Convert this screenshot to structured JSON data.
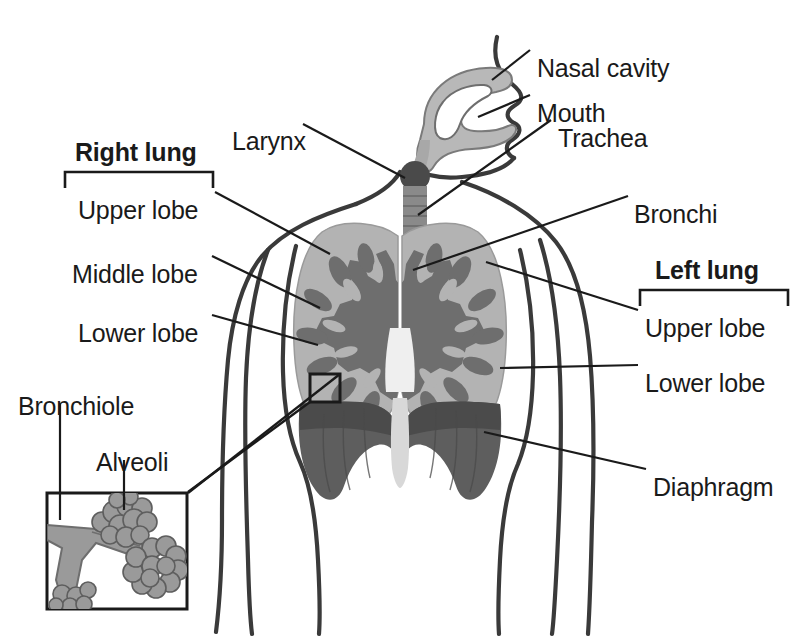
{
  "diagram": {
    "background_color": "#ffffff",
    "ink_color": "#3a3a3a",
    "text_color": "#1a1a1a",
    "palette": {
      "lung_tissue": "#b3b3b3",
      "bronchial_tree": "#6e6e6e",
      "diaphragm": "#5e5e5e",
      "trachea": "#8a8a8a",
      "larynx": "#4a4a4a",
      "head_cavity": "#b8b8b8",
      "mediastinum": "#efefef",
      "alveoli": "#9a9a9a"
    }
  },
  "group_labels": [
    {
      "id": "right-lung",
      "text": "Right lung",
      "x": 75,
      "y": 140,
      "bracket": {
        "x": 65,
        "y": 172,
        "width": 148
      }
    },
    {
      "id": "left-lung",
      "text": "Left lung",
      "x": 655,
      "y": 258,
      "bracket": {
        "x": 640,
        "y": 290,
        "width": 148
      }
    }
  ],
  "labels": [
    {
      "id": "nasal-cavity",
      "text": "Nasal cavity",
      "x": 537,
      "y": 56,
      "align": "left"
    },
    {
      "id": "mouth",
      "text": "Mouth",
      "x": 537,
      "y": 101,
      "align": "left"
    },
    {
      "id": "trachea",
      "text": "Trachea",
      "x": 558,
      "y": 126,
      "align": "left"
    },
    {
      "id": "bronchi",
      "text": "Bronchi",
      "x": 634,
      "y": 202,
      "align": "left"
    },
    {
      "id": "larynx",
      "text": "Larynx",
      "x": 232,
      "y": 129,
      "align": "left"
    },
    {
      "id": "right-upper-lobe",
      "text": "Upper lobe",
      "x": 78,
      "y": 198,
      "align": "left"
    },
    {
      "id": "right-middle-lobe",
      "text": "Middle lobe",
      "x": 72,
      "y": 262,
      "align": "left"
    },
    {
      "id": "right-lower-lobe",
      "text": "Lower lobe",
      "x": 78,
      "y": 321,
      "align": "left"
    },
    {
      "id": "left-upper-lobe",
      "text": "Upper lobe",
      "x": 645,
      "y": 316,
      "align": "left"
    },
    {
      "id": "left-lower-lobe",
      "text": "Lower lobe",
      "x": 645,
      "y": 371,
      "align": "left"
    },
    {
      "id": "diaphragm",
      "text": "Diaphragm",
      "x": 653,
      "y": 475,
      "align": "left"
    },
    {
      "id": "bronchiole",
      "text": "Bronchiole",
      "x": 18,
      "y": 394,
      "align": "left"
    },
    {
      "id": "alveoli",
      "text": "Alveoli",
      "x": 96,
      "y": 450,
      "align": "left"
    }
  ],
  "inset": {
    "id": "alveoli-detail-inset",
    "x": 46,
    "y": 492,
    "width": 142,
    "height": 118,
    "callout_target": {
      "x": 310,
      "y": 375
    }
  },
  "structures": [
    {
      "id": "nasal-cavity",
      "kind": "airway"
    },
    {
      "id": "mouth",
      "kind": "airway"
    },
    {
      "id": "larynx",
      "kind": "airway"
    },
    {
      "id": "trachea",
      "kind": "airway"
    },
    {
      "id": "bronchi",
      "kind": "airway"
    },
    {
      "id": "bronchiole",
      "kind": "airway"
    },
    {
      "id": "alveoli",
      "kind": "gas-exchange"
    },
    {
      "id": "right-lung",
      "kind": "lung",
      "lobes": [
        "Upper lobe",
        "Middle lobe",
        "Lower lobe"
      ]
    },
    {
      "id": "left-lung",
      "kind": "lung",
      "lobes": [
        "Upper lobe",
        "Lower lobe"
      ]
    },
    {
      "id": "diaphragm",
      "kind": "muscle"
    }
  ]
}
